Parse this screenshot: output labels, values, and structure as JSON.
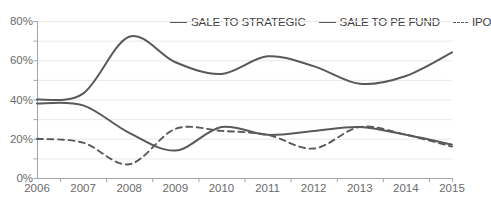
{
  "chart_data": {
    "type": "line",
    "title": "",
    "xlabel": "",
    "ylabel": "",
    "x": [
      2006,
      2007,
      2008,
      2009,
      2010,
      2011,
      2012,
      2013,
      2014,
      2015
    ],
    "categories": [
      "2006",
      "2007",
      "2008",
      "2009",
      "2010",
      "2011",
      "2012",
      "2013",
      "2014",
      "2015"
    ],
    "xlim": [
      2006,
      2015
    ],
    "ylim": [
      0,
      80
    ],
    "yticks": [
      0,
      20,
      40,
      60,
      80
    ],
    "ytick_labels": [
      "0%",
      "20%",
      "40%",
      "60%",
      "80%"
    ],
    "yminor_step": 10,
    "grid": true,
    "grid_axis": "y",
    "legend_position": "top-right",
    "series": [
      {
        "name": "SALE TO STRATEGIC",
        "style": "solid",
        "color": "#595959",
        "values": [
          40,
          43,
          72,
          59,
          53,
          62,
          57,
          48,
          52,
          64
        ]
      },
      {
        "name": "SALE TO PE FUND",
        "style": "solid",
        "color": "#595959",
        "values": [
          38,
          37,
          23,
          14,
          26,
          22,
          24,
          26,
          22,
          17
        ]
      },
      {
        "name": "IPO",
        "style": "dashed",
        "color": "#595959",
        "values": [
          20,
          18,
          7,
          25,
          24,
          22,
          15,
          26,
          22,
          16
        ]
      }
    ]
  },
  "legend": {
    "items": [
      {
        "label": "SALE TO STRATEGIC",
        "style": "solid"
      },
      {
        "label": "SALE TO PE FUND",
        "style": "solid"
      },
      {
        "label": "IPO",
        "style": "dashed"
      }
    ]
  },
  "axis": {
    "y_labels": [
      "80%",
      "60%",
      "40%",
      "20%",
      "0%"
    ],
    "x_labels": [
      "2006",
      "2007",
      "2008",
      "2009",
      "2010",
      "2011",
      "2012",
      "2013",
      "2014",
      "2015"
    ]
  },
  "colors": {
    "line": "#595959",
    "grid": "#e8e8e8",
    "axis": "#a6a6a6",
    "text": "#6b6b6b",
    "legend_text": "#404040"
  }
}
